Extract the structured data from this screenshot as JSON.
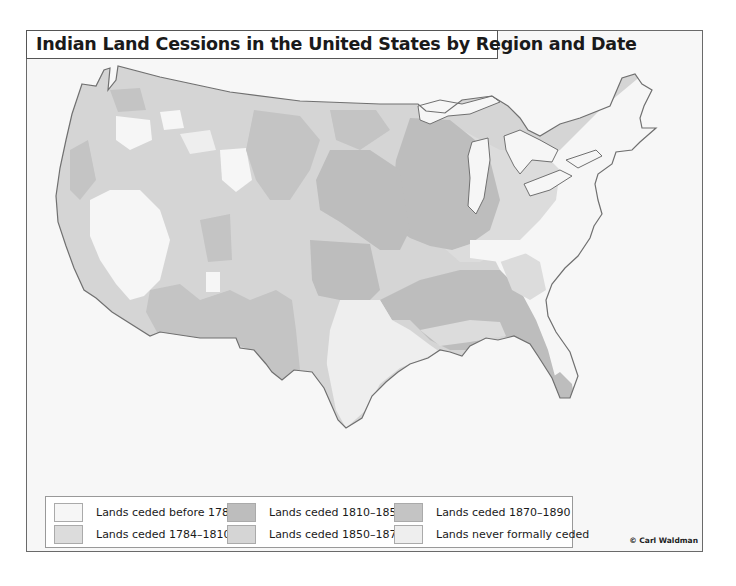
{
  "map": {
    "title": "Indian Land Cessions in the United States by Region and Date",
    "credit": "© Carl Waldman",
    "colors": {
      "before_1784": "#f6f6f6",
      "c1784_1810": "#dcdcdc",
      "c1810_1850": "#bdbdbd",
      "c1850_1870": "#d5d5d5",
      "c1870_1890": "#c4c4c4",
      "never": "#eeeeee",
      "frame_bg": "#f7f7f7",
      "coast": "#707070"
    }
  },
  "legend": {
    "items": [
      {
        "label": "Lands ceded before 1784",
        "color": "#f6f6f6"
      },
      {
        "label": "Lands ceded 1810–1850",
        "color": "#bdbdbd"
      },
      {
        "label": "Lands ceded 1870–1890",
        "color": "#c4c4c4"
      },
      {
        "label": "Lands ceded 1784–1810",
        "color": "#dcdcdc"
      },
      {
        "label": "Lands ceded 1850–1870",
        "color": "#d5d5d5"
      },
      {
        "label": "Lands never formally ceded",
        "color": "#eeeeee"
      }
    ]
  }
}
